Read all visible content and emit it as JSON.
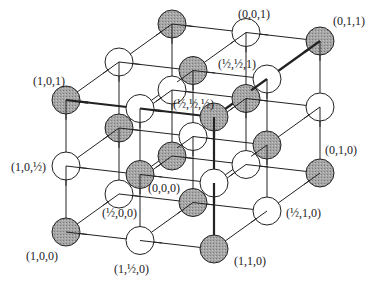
{
  "diagram": {
    "colors": {
      "shaded_atom": "#a6a6a6",
      "open_atom": "#ffffff",
      "line": "#222222",
      "text": "#1a1a1a"
    },
    "grid": {
      "origin_px": [
        172,
        24
      ],
      "step_x_px": [
        -53,
        38
      ],
      "step_y_px": [
        74,
        8.5
      ],
      "step_z_px": [
        0,
        -66
      ],
      "atom_radius": 14,
      "shading_rule": "shaded when (i+j+k) even, open when odd (i,j,k in half-steps)"
    },
    "labels": [
      {
        "id": "lbl-001",
        "text": "(0,0,1)",
        "x": 238,
        "y": 8
      },
      {
        "id": "lbl-011",
        "text": "(0,1,1)",
        "x": 333,
        "y": 15
      },
      {
        "id": "lbl-hh1",
        "text": "(½,½,1)",
        "x": 218,
        "y": 58
      },
      {
        "id": "lbl-101",
        "text": "(1,0,1)",
        "x": 33,
        "y": 75
      },
      {
        "id": "lbl-hhh",
        "text": "(½,½,½)",
        "x": 173,
        "y": 98
      },
      {
        "id": "lbl-10h",
        "text": "(1,0,½)",
        "x": 11,
        "y": 161
      },
      {
        "id": "lbl-000",
        "text": "(0,0,0)",
        "x": 148,
        "y": 182
      },
      {
        "id": "lbl-010",
        "text": "(0,1,0)",
        "x": 325,
        "y": 144
      },
      {
        "id": "lbl-h00",
        "text": "(½,0,0)",
        "x": 102,
        "y": 207
      },
      {
        "id": "lbl-h10",
        "text": "(½,1,0)",
        "x": 286,
        "y": 207
      },
      {
        "id": "lbl-100",
        "text": "(1,0,0)",
        "x": 26,
        "y": 250
      },
      {
        "id": "lbl-1h0",
        "text": "(1,½,0)",
        "x": 114,
        "y": 263
      },
      {
        "id": "lbl-110",
        "text": "(1,1,0)",
        "x": 234,
        "y": 255
      }
    ]
  }
}
